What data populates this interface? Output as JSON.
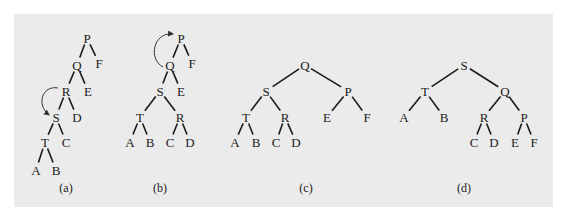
{
  "figure": {
    "background": "#ebebeb",
    "panels": [
      {
        "id": "a",
        "caption": "(a)",
        "nodes": {
          "P": {
            "label": "P",
            "x": 87,
            "y": 38
          },
          "Q": {
            "label": "Q",
            "x": 77,
            "y": 65
          },
          "F": {
            "label": "F",
            "x": 99,
            "y": 63
          },
          "R": {
            "label": "R",
            "x": 66,
            "y": 91
          },
          "E": {
            "label": "E",
            "x": 88,
            "y": 91
          },
          "S": {
            "label": "S",
            "x": 56,
            "y": 117
          },
          "D": {
            "label": "D",
            "x": 77,
            "y": 117
          },
          "T": {
            "label": "T",
            "x": 45,
            "y": 142
          },
          "C": {
            "label": "C",
            "x": 66,
            "y": 142
          },
          "A": {
            "label": "A",
            "x": 36,
            "y": 170
          },
          "B": {
            "label": "B",
            "x": 56,
            "y": 170
          }
        },
        "edges": [
          [
            "P",
            "Q"
          ],
          [
            "P",
            "F"
          ],
          [
            "Q",
            "R"
          ],
          [
            "Q",
            "E"
          ],
          [
            "R",
            "S"
          ],
          [
            "R",
            "D"
          ],
          [
            "S",
            "T"
          ],
          [
            "S",
            "C"
          ],
          [
            "T",
            "A"
          ],
          [
            "T",
            "B"
          ]
        ],
        "rotation_arrow": {
          "from": "R",
          "to": "S"
        },
        "caption_pos": {
          "x": 66,
          "y": 192
        }
      },
      {
        "id": "b",
        "caption": "(b)",
        "nodes": {
          "P": {
            "label": "P",
            "x": 181,
            "y": 38
          },
          "Q": {
            "label": "Q",
            "x": 170,
            "y": 65
          },
          "F": {
            "label": "F",
            "x": 192,
            "y": 63
          },
          "S": {
            "label": "S",
            "x": 160,
            "y": 91
          },
          "E": {
            "label": "E",
            "x": 181,
            "y": 91
          },
          "T": {
            "label": "T",
            "x": 140,
            "y": 117
          },
          "R": {
            "label": "R",
            "x": 180,
            "y": 117
          },
          "A": {
            "label": "A",
            "x": 130,
            "y": 142
          },
          "B": {
            "label": "B",
            "x": 150,
            "y": 142
          },
          "C": {
            "label": "C",
            "x": 170,
            "y": 142
          },
          "D": {
            "label": "D",
            "x": 190,
            "y": 142
          }
        },
        "edges": [
          [
            "P",
            "Q"
          ],
          [
            "P",
            "F"
          ],
          [
            "Q",
            "S"
          ],
          [
            "Q",
            "E"
          ],
          [
            "S",
            "T"
          ],
          [
            "S",
            "R"
          ],
          [
            "T",
            "A"
          ],
          [
            "T",
            "B"
          ],
          [
            "R",
            "C"
          ],
          [
            "R",
            "D"
          ]
        ],
        "rotation_arrow": {
          "from": "Q",
          "to": "P"
        },
        "caption_pos": {
          "x": 160,
          "y": 192
        }
      },
      {
        "id": "c",
        "caption": "(c)",
        "nodes": {
          "Q": {
            "label": "Q",
            "x": 305,
            "y": 65
          },
          "S": {
            "label": "S",
            "x": 266,
            "y": 91
          },
          "P": {
            "label": "P",
            "x": 348,
            "y": 91
          },
          "T": {
            "label": "T",
            "x": 246,
            "y": 117
          },
          "R": {
            "label": "R",
            "x": 285,
            "y": 117
          },
          "E": {
            "label": "E",
            "x": 327,
            "y": 117
          },
          "F": {
            "label": "F",
            "x": 367,
            "y": 117
          },
          "A": {
            "label": "A",
            "x": 235,
            "y": 142
          },
          "B": {
            "label": "B",
            "x": 256,
            "y": 142
          },
          "C": {
            "label": "C",
            "x": 276,
            "y": 142
          },
          "D": {
            "label": "D",
            "x": 296,
            "y": 142
          }
        },
        "edges": [
          [
            "Q",
            "S"
          ],
          [
            "Q",
            "P"
          ],
          [
            "S",
            "T"
          ],
          [
            "S",
            "R"
          ],
          [
            "P",
            "E"
          ],
          [
            "P",
            "F"
          ],
          [
            "T",
            "A"
          ],
          [
            "T",
            "B"
          ],
          [
            "R",
            "C"
          ],
          [
            "R",
            "D"
          ]
        ],
        "caption_pos": {
          "x": 306,
          "y": 192
        }
      },
      {
        "id": "d",
        "caption": "(d)",
        "nodes": {
          "S": {
            "label": "S",
            "x": 464,
            "y": 65
          },
          "T": {
            "label": "T",
            "x": 425,
            "y": 91
          },
          "Q": {
            "label": "Q",
            "x": 505,
            "y": 91
          },
          "A": {
            "label": "A",
            "x": 404,
            "y": 117
          },
          "B": {
            "label": "B",
            "x": 444,
            "y": 117
          },
          "R": {
            "label": "R",
            "x": 484,
            "y": 117
          },
          "P": {
            "label": "P",
            "x": 524,
            "y": 117
          },
          "C": {
            "label": "C",
            "x": 474,
            "y": 142
          },
          "D": {
            "label": "D",
            "x": 494,
            "y": 142
          },
          "E": {
            "label": "E",
            "x": 515,
            "y": 142
          },
          "F": {
            "label": "F",
            "x": 534,
            "y": 142
          }
        },
        "edges": [
          [
            "S",
            "T"
          ],
          [
            "S",
            "Q"
          ],
          [
            "T",
            "A"
          ],
          [
            "T",
            "B"
          ],
          [
            "Q",
            "R"
          ],
          [
            "Q",
            "P"
          ],
          [
            "R",
            "C"
          ],
          [
            "R",
            "D"
          ],
          [
            "P",
            "E"
          ],
          [
            "P",
            "F"
          ]
        ],
        "caption_pos": {
          "x": 464,
          "y": 192
        }
      }
    ]
  }
}
